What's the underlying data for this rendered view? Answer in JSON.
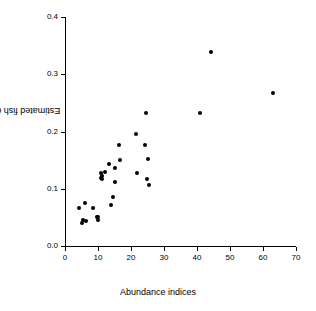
{
  "chart_data": {
    "type": "scatter",
    "title": "",
    "subtitle": "",
    "xlabel": "Abundance indices",
    "ylabel": "Estimated fish density",
    "xlim": [
      0,
      70
    ],
    "ylim": [
      0.0,
      0.4
    ],
    "xticks": [
      0,
      10,
      20,
      30,
      40,
      50,
      60,
      70
    ],
    "xticklabels": [
      "0",
      "10",
      "20",
      "30",
      "40",
      "50",
      "60",
      "70"
    ],
    "yticks": [
      0.0,
      0.1,
      0.2,
      0.3,
      0.4
    ],
    "yticklabels": [
      "0.0",
      "0.1",
      "0.2",
      "0.3",
      "0.4"
    ],
    "grid": false,
    "legend": false,
    "marker": "filled-circle",
    "marker_color": "#000000",
    "marker_size": 4,
    "series": [
      {
        "name": "sites",
        "points": [
          {
            "x": 4.3,
            "y": 0.066
          },
          {
            "x": 5.2,
            "y": 0.04
          },
          {
            "x": 5.6,
            "y": 0.045
          },
          {
            "x": 6.0,
            "y": 0.075
          },
          {
            "x": 6.4,
            "y": 0.043
          },
          {
            "x": 8.6,
            "y": 0.067
          },
          {
            "x": 9.8,
            "y": 0.05
          },
          {
            "x": 9.9,
            "y": 0.046
          },
          {
            "x": 10.1,
            "y": 0.051
          },
          {
            "x": 10.8,
            "y": 0.128
          },
          {
            "x": 10.9,
            "y": 0.118
          },
          {
            "x": 11.1,
            "y": 0.122
          },
          {
            "x": 11.3,
            "y": 0.117
          },
          {
            "x": 12.2,
            "y": 0.129
          },
          {
            "x": 13.3,
            "y": 0.144
          },
          {
            "x": 13.8,
            "y": 0.072
          },
          {
            "x": 14.4,
            "y": 0.086
          },
          {
            "x": 15.0,
            "y": 0.137
          },
          {
            "x": 15.3,
            "y": 0.111
          },
          {
            "x": 16.4,
            "y": 0.177
          },
          {
            "x": 16.8,
            "y": 0.151
          },
          {
            "x": 21.4,
            "y": 0.196
          },
          {
            "x": 21.8,
            "y": 0.128
          },
          {
            "x": 24.3,
            "y": 0.177
          },
          {
            "x": 24.6,
            "y": 0.232
          },
          {
            "x": 24.8,
            "y": 0.117
          },
          {
            "x": 25.0,
            "y": 0.152
          },
          {
            "x": 25.6,
            "y": 0.107
          },
          {
            "x": 41.0,
            "y": 0.232
          },
          {
            "x": 44.1,
            "y": 0.338
          },
          {
            "x": 63.0,
            "y": 0.268
          }
        ]
      }
    ]
  }
}
